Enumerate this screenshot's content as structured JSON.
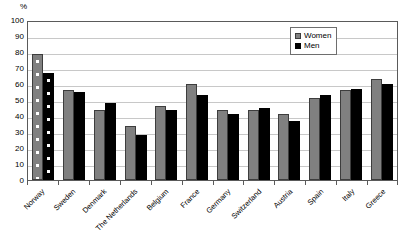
{
  "chart_data": {
    "type": "bar",
    "title": "",
    "xlabel": "",
    "ylabel": "%",
    "ylim": [
      0,
      100
    ],
    "ytick_step": 10,
    "yticks": [
      100,
      90,
      80,
      70,
      60,
      50,
      40,
      30,
      20,
      10,
      0
    ],
    "grid": true,
    "legend_position": "top-right",
    "categories": [
      "Norway",
      "Sweden",
      "Denmark",
      "The Netherlands",
      "Belgium",
      "France",
      "Germany",
      "Switzerland",
      "Austria",
      "Spain",
      "Italy",
      "Greece"
    ],
    "series": [
      {
        "name": "Women",
        "color": "#808080",
        "values": [
          79,
          56,
          44,
          34,
          46,
          60,
          44,
          44,
          41,
          51,
          56,
          63
        ]
      },
      {
        "name": "Men",
        "color": "#000000",
        "values": [
          67,
          55,
          48,
          28,
          44,
          53,
          41,
          45,
          37,
          53,
          57,
          60
        ]
      }
    ],
    "highlighted_category": "Norway",
    "highlight_pattern": "dotted"
  },
  "legend": {
    "items": [
      {
        "label": "Women",
        "swatch": "women"
      },
      {
        "label": "Men",
        "swatch": "men"
      }
    ]
  },
  "axis": {
    "y_unit": "%"
  }
}
